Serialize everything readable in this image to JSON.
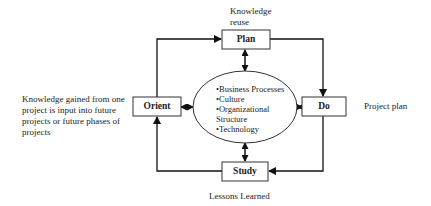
{
  "nodes": {
    "plan": {
      "label": "Plan"
    },
    "do": {
      "label": "Do"
    },
    "study": {
      "label": "Study"
    },
    "orient": {
      "label": "Orient"
    }
  },
  "center": {
    "items": [
      "•Business Processes",
      "•Culture",
      "•Organizational",
      "Structure",
      "•Technology"
    ]
  },
  "annotations": {
    "plan_line1": "Knowledge",
    "plan_line2": "reuse",
    "do": "Project plan",
    "study": "Lessons Learned",
    "orient_lines": [
      "Knowledge gained from one",
      "project is input into future",
      "projects or future phases of",
      "projects"
    ]
  }
}
